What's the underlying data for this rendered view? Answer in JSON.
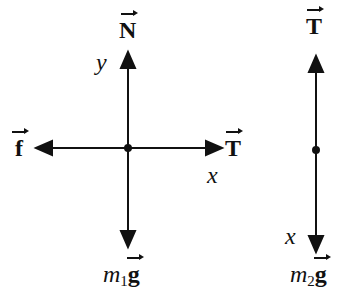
{
  "diagram": {
    "stroke_color": "#111111",
    "background": "#ffffff",
    "body1": {
      "center": [
        128,
        148
      ],
      "forces": [
        {
          "name": "normal",
          "label": "N",
          "direction": "up"
        },
        {
          "name": "friction",
          "label": "f",
          "direction": "left"
        },
        {
          "name": "tension",
          "label": "T",
          "direction": "right"
        },
        {
          "name": "weight",
          "label_prefix": "m",
          "label_sub": "1",
          "label_vec": "g",
          "direction": "down"
        }
      ],
      "axes": {
        "y_label": "y",
        "x_label": "x"
      }
    },
    "body2": {
      "center": [
        316,
        150
      ],
      "forces": [
        {
          "name": "tension",
          "label": "T",
          "direction": "up"
        },
        {
          "name": "weight",
          "label_prefix": "m",
          "label_sub": "2",
          "label_vec": "g",
          "direction": "down"
        }
      ],
      "axes": {
        "x_label": "x"
      }
    }
  }
}
